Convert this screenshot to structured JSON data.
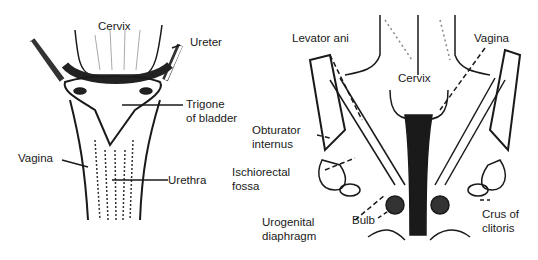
{
  "figures": [
    {
      "id": "left",
      "description": "Frontal view: bladder trigone and urethra with vagina",
      "labels": {
        "cervix": "Cervix",
        "ureter": "Ureter",
        "trigone_1": "Trigone",
        "trigone_2": "of bladder",
        "vagina": "Vagina",
        "urethra": "Urethra"
      }
    },
    {
      "id": "right",
      "description": "Coronal section: pelvic floor",
      "labels": {
        "levator_ani": "Levator ani",
        "vagina": "Vagina",
        "cervix": "Cervix",
        "obturator_1": "Obturator",
        "obturator_2": "internus",
        "ischiorectal_1": "Ischiorectal",
        "ischiorectal_2": "fossa",
        "urogenital_1": "Urogenital",
        "urogenital_2": "diaphragm",
        "bulb": "Bulb",
        "crus_1": "Crus of",
        "crus_2": "clitoris"
      }
    }
  ],
  "colors": {
    "ink": "#1a1a1a",
    "background": "#ffffff"
  }
}
